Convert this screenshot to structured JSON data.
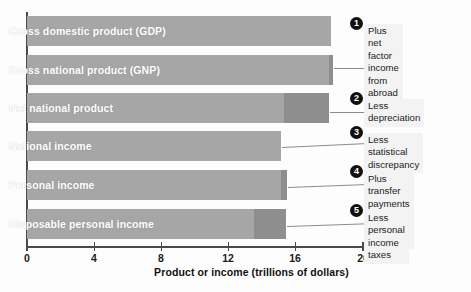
{
  "chart_data": {
    "type": "bar",
    "orientation": "horizontal",
    "title": "",
    "xlabel": "Product or income (trillions of dollars)",
    "ylabel": "",
    "xlim": [
      0,
      20
    ],
    "xticks": [
      0,
      4,
      8,
      12,
      16,
      20
    ],
    "xtick_labels": [
      "0",
      "4",
      "8",
      "12",
      "16",
      "20"
    ],
    "grid": false,
    "legend": "none",
    "categories": [
      "Gross domestic product (GDP)",
      "Gross national product (GNP)",
      "Net national product",
      "National income",
      "Personal income",
      "Disposable personal income"
    ],
    "values": [
      18.1,
      18.2,
      18.0,
      15.1,
      15.5,
      15.4
    ],
    "series": [
      {
        "name": "Primary (light) segment",
        "values": [
          18.1,
          18.0,
          15.3,
          15.1,
          15.1,
          13.5
        ]
      },
      {
        "name": "Adjustment (dark) segment end",
        "values": [
          18.1,
          18.2,
          18.0,
          15.1,
          15.5,
          15.4
        ]
      }
    ],
    "annotations": [
      {
        "number": "1",
        "text": "Plus net factor\nincome from\nabroad"
      },
      {
        "number": "2",
        "text": "Less depreciation"
      },
      {
        "number": "3",
        "text": "Less statistical\ndiscrepancy"
      },
      {
        "number": "4",
        "text": "Plus transfer payments\nless retained profits"
      },
      {
        "number": "5",
        "text": "Less personal\nincome taxes"
      }
    ],
    "colors": {
      "bar_light": "#a6a6a6",
      "bar_dark": "#8e8e8e",
      "axis": "#4a4a4a",
      "bar_label_text": "#ffffff",
      "callout_badge": "#101010",
      "callout_text_bg": "#f3f3f3",
      "background": "#fdfdfd"
    }
  },
  "bars": [
    {
      "label": "Gross domestic product (GDP)",
      "light_end": 18.1,
      "dark_start": 18.1,
      "dark_end": 18.1
    },
    {
      "label": "Gross national product (GNP)",
      "light_end": 18.0,
      "dark_start": 18.0,
      "dark_end": 18.2
    },
    {
      "label": "Net national product",
      "light_end": 15.3,
      "dark_start": 15.3,
      "dark_end": 18.0
    },
    {
      "label": "National income",
      "light_end": 15.1,
      "dark_start": 15.1,
      "dark_end": 15.1
    },
    {
      "label": "Personal income",
      "light_end": 15.1,
      "dark_start": 15.1,
      "dark_end": 15.5
    },
    {
      "label": "Disposable personal income",
      "light_end": 13.5,
      "dark_start": 13.5,
      "dark_end": 15.4
    }
  ],
  "axis": {
    "ticks": [
      "0",
      "4",
      "8",
      "12",
      "16",
      "20"
    ],
    "title": "Product or income (trillions of dollars)"
  },
  "callouts": [
    {
      "number": "1",
      "text": "Plus net factor\nincome from\nabroad"
    },
    {
      "number": "2",
      "text": "Less depreciation"
    },
    {
      "number": "3",
      "text": "Less statistical\ndiscrepancy"
    },
    {
      "number": "4",
      "text": "Plus transfer payments\nless retained profits"
    },
    {
      "number": "5",
      "text": "Less personal\nincome taxes"
    }
  ]
}
